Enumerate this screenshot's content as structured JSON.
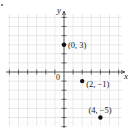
{
  "chart_data": {
    "type": "scatter",
    "title": "",
    "xlabel": "x",
    "ylabel": "y",
    "origin_label": "0",
    "xlim": [
      -6,
      6
    ],
    "ylim": [
      -6,
      6
    ],
    "grid": true,
    "points": [
      {
        "x": 0,
        "y": 3,
        "label": "(0, 3)"
      },
      {
        "x": 2,
        "y": -1,
        "label": "(2, −1)"
      },
      {
        "x": 4,
        "y": -5,
        "label": "(4, −5)"
      }
    ]
  },
  "colors": {
    "axis": "#333333",
    "grid": "#d9d9d9",
    "point": "#111111"
  }
}
